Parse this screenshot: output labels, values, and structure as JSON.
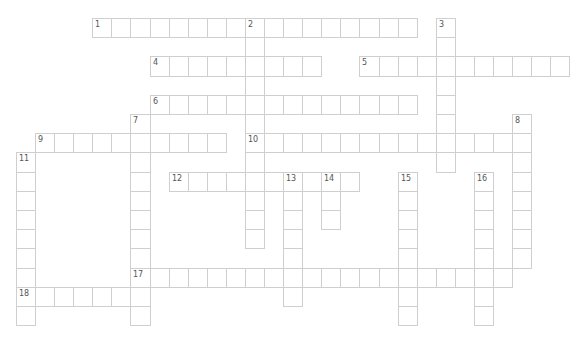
{
  "puzzle": {
    "type": "crossword",
    "grid_origin": {
      "x": 16,
      "y": 18
    },
    "cell_size": {
      "w": 19.08,
      "h": 19.2
    },
    "colors": {
      "border": "#cfcfcf",
      "number": "#555555",
      "background": "#ffffff"
    },
    "entries": [
      {
        "number": "1",
        "direction": "across",
        "row": 0,
        "col": 4,
        "length": 17
      },
      {
        "number": "2",
        "direction": "down",
        "row": 0,
        "col": 12,
        "length": 12
      },
      {
        "number": "3",
        "direction": "down",
        "row": 0,
        "col": 22,
        "length": 8
      },
      {
        "number": "4",
        "direction": "across",
        "row": 2,
        "col": 7,
        "length": 9
      },
      {
        "number": "5",
        "direction": "across",
        "row": 2,
        "col": 18,
        "length": 11
      },
      {
        "number": "6",
        "direction": "across",
        "row": 4,
        "col": 7,
        "length": 14
      },
      {
        "number": "7",
        "direction": "down",
        "row": 5,
        "col": 6,
        "length": 11
      },
      {
        "number": "8",
        "direction": "down",
        "row": 5,
        "col": 26,
        "length": 8
      },
      {
        "number": "9",
        "direction": "across",
        "row": 6,
        "col": 1,
        "length": 10
      },
      {
        "number": "10",
        "direction": "across",
        "row": 6,
        "col": 12,
        "length": 15
      },
      {
        "number": "11",
        "direction": "down",
        "row": 7,
        "col": 0,
        "length": 9
      },
      {
        "number": "12",
        "direction": "across",
        "row": 8,
        "col": 8,
        "length": 10
      },
      {
        "number": "13",
        "direction": "down",
        "row": 8,
        "col": 14,
        "length": 7
      },
      {
        "number": "14",
        "direction": "down",
        "row": 8,
        "col": 16,
        "length": 3
      },
      {
        "number": "15",
        "direction": "down",
        "row": 8,
        "col": 20,
        "length": 8
      },
      {
        "number": "16",
        "direction": "down",
        "row": 8,
        "col": 24,
        "length": 8
      },
      {
        "number": "17",
        "direction": "across",
        "row": 13,
        "col": 6,
        "length": 20
      },
      {
        "number": "18",
        "direction": "across",
        "row": 14,
        "col": 0,
        "length": 7
      }
    ]
  }
}
